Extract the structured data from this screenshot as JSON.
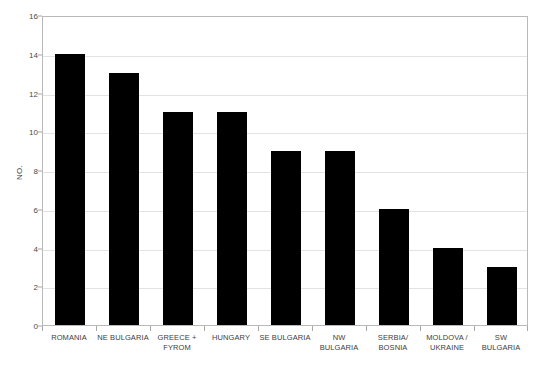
{
  "chart_data": {
    "type": "bar",
    "title": "",
    "xlabel": "",
    "ylabel": "NO.",
    "categories": [
      "ROMANIA",
      "NE BULGARIA",
      "GREECE + FYROM",
      "HUNGARY",
      "SE BULGARIA",
      "NW BULGARIA",
      "SERBIA/ BOSNIA",
      "MOLDOVA / UKRAINE",
      "SW BULGARIA"
    ],
    "category_lines": [
      [
        "ROMANIA"
      ],
      [
        "NE BULGARIA"
      ],
      [
        "GREECE +",
        "FYROM"
      ],
      [
        "HUNGARY"
      ],
      [
        "SE BULGARIA"
      ],
      [
        "NW",
        "BULGARIA"
      ],
      [
        "SERBIA/",
        "BOSNIA"
      ],
      [
        "MOLDOVA /",
        "UKRAINE"
      ],
      [
        "SW",
        "BULGARIA"
      ]
    ],
    "values": [
      14,
      13,
      11,
      11,
      9,
      9,
      6,
      4,
      3
    ],
    "ylim": [
      0,
      16
    ],
    "ytick_values": [
      0,
      2,
      4,
      6,
      8,
      10,
      12,
      14,
      16
    ],
    "ytick_labels": [
      "0",
      "2",
      "4",
      "6",
      "8",
      "10",
      "12",
      "14",
      "16"
    ],
    "grid": true,
    "legend": "none",
    "bar_color": "#000000",
    "grid_color": "#e3e3e3",
    "frame_color": "#b9b9b9",
    "background_color": "#ffffff"
  },
  "figure": {
    "caption_fragment": ""
  }
}
